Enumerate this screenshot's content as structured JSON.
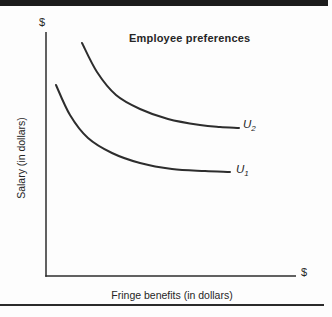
{
  "page": {
    "background": "#fdfdfd",
    "top_bar_color": "#1c1c1c",
    "bottom_rule_color": "#2b2b2b"
  },
  "chart_data": {
    "type": "line",
    "title": "Employee preferences",
    "xlabel": "Fringe benefits (in dollars)",
    "ylabel": "Salary (in dollars)",
    "x_axis_end_label": "$",
    "y_axis_end_label": "$",
    "grid": false,
    "axes_numeric": false,
    "legend_position": "labels-at-curve-ends",
    "line_color": "#2d2d2d",
    "axis_color": "#2d2d2d",
    "series": [
      {
        "name": "u2",
        "label_letter": "U",
        "label_sub": "2",
        "points_px": [
          [
            82,
            43
          ],
          [
            97,
            72
          ],
          [
            116,
            95
          ],
          [
            140,
            109
          ],
          [
            168,
            119
          ],
          [
            200,
            125
          ],
          [
            220,
            127
          ],
          [
            239,
            128
          ]
        ]
      },
      {
        "name": "u1",
        "label_letter": "U",
        "label_sub": "1",
        "points_px": [
          [
            56,
            85
          ],
          [
            70,
            115
          ],
          [
            88,
            138
          ],
          [
            112,
            153
          ],
          [
            140,
            163
          ],
          [
            172,
            169
          ],
          [
            205,
            171
          ],
          [
            230,
            172
          ]
        ]
      }
    ]
  }
}
